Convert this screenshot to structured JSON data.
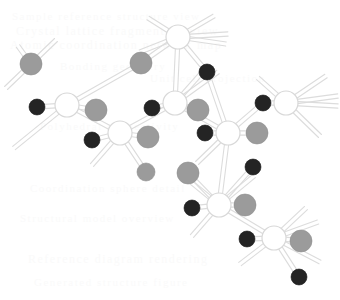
{
  "figure": {
    "width": 340,
    "height": 300,
    "background_color": "#ffffff"
  },
  "legend": {
    "atom_types": [
      {
        "key": "open",
        "label": "Open ring atom",
        "fill": "#ffffff",
        "stroke": "#d8d8d8",
        "radius": 11
      },
      {
        "key": "gray",
        "label": "Gray sphere atom",
        "fill": "#9b9b9b",
        "stroke": "#8f8f8f",
        "radius": 11
      },
      {
        "key": "dark",
        "label": "Dark sphere atom",
        "fill": "#242424",
        "stroke": "#1a1a1a",
        "radius": 8
      }
    ],
    "bond_style": {
      "label": "Double line bond",
      "color": "#dcdcdc",
      "width": 1.1,
      "offset": 2.1
    }
  },
  "structure": {
    "atoms": [
      {
        "id": "a1",
        "type": "open",
        "x": 178,
        "y": 37,
        "r": 12
      },
      {
        "id": "a2",
        "type": "gray",
        "x": 31,
        "y": 64,
        "r": 11
      },
      {
        "id": "a3",
        "type": "gray",
        "x": 141,
        "y": 63,
        "r": 11
      },
      {
        "id": "a4",
        "type": "dark",
        "x": 207,
        "y": 72,
        "r": 8
      },
      {
        "id": "a5",
        "type": "open",
        "x": 67,
        "y": 105,
        "r": 12
      },
      {
        "id": "a6",
        "type": "dark",
        "x": 37,
        "y": 107,
        "r": 8
      },
      {
        "id": "a7",
        "type": "open",
        "x": 175,
        "y": 103,
        "r": 12
      },
      {
        "id": "a8",
        "type": "dark",
        "x": 152,
        "y": 108,
        "r": 8
      },
      {
        "id": "a9",
        "type": "gray",
        "x": 198,
        "y": 110,
        "r": 11
      },
      {
        "id": "a10",
        "type": "open",
        "x": 286,
        "y": 103,
        "r": 12
      },
      {
        "id": "a11",
        "type": "dark",
        "x": 263,
        "y": 103,
        "r": 8
      },
      {
        "id": "a12",
        "type": "gray",
        "x": 96,
        "y": 110,
        "r": 11
      },
      {
        "id": "a13",
        "type": "open",
        "x": 120,
        "y": 133,
        "r": 12
      },
      {
        "id": "a14",
        "type": "dark",
        "x": 92,
        "y": 140,
        "r": 8
      },
      {
        "id": "a15",
        "type": "gray",
        "x": 148,
        "y": 137,
        "r": 11
      },
      {
        "id": "a16",
        "type": "open",
        "x": 228,
        "y": 133,
        "r": 12
      },
      {
        "id": "a17",
        "type": "dark",
        "x": 205,
        "y": 133,
        "r": 8
      },
      {
        "id": "a18",
        "type": "gray",
        "x": 257,
        "y": 133,
        "r": 11
      },
      {
        "id": "a19",
        "type": "gray",
        "x": 146,
        "y": 172,
        "r": 9
      },
      {
        "id": "a20",
        "type": "gray",
        "x": 188,
        "y": 173,
        "r": 11
      },
      {
        "id": "a21",
        "type": "dark",
        "x": 253,
        "y": 167,
        "r": 8
      },
      {
        "id": "a22",
        "type": "open",
        "x": 219,
        "y": 205,
        "r": 12
      },
      {
        "id": "a23",
        "type": "dark",
        "x": 192,
        "y": 208,
        "r": 8
      },
      {
        "id": "a24",
        "type": "gray",
        "x": 245,
        "y": 205,
        "r": 11
      },
      {
        "id": "a25",
        "type": "dark",
        "x": 247,
        "y": 239,
        "r": 8
      },
      {
        "id": "a26",
        "type": "open",
        "x": 274,
        "y": 238,
        "r": 12
      },
      {
        "id": "a27",
        "type": "gray",
        "x": 301,
        "y": 241,
        "r": 11
      },
      {
        "id": "a28",
        "type": "dark",
        "x": 299,
        "y": 277,
        "r": 8
      }
    ],
    "bonds": [
      {
        "from": "a1",
        "to": "a3"
      },
      {
        "from": "a1",
        "to": "a4"
      },
      {
        "from": "a1",
        "to": "a7"
      },
      {
        "from": "a3",
        "to": "a5"
      },
      {
        "from": "a5",
        "to": "a6"
      },
      {
        "from": "a5",
        "to": "a12"
      },
      {
        "from": "a5",
        "to": "a13"
      },
      {
        "from": "a7",
        "to": "a8"
      },
      {
        "from": "a7",
        "to": "a9"
      },
      {
        "from": "a7",
        "to": "a13"
      },
      {
        "from": "a7",
        "to": "a16"
      },
      {
        "from": "a4",
        "to": "a16"
      },
      {
        "from": "a10",
        "to": "a11"
      },
      {
        "from": "a11",
        "to": "a16"
      },
      {
        "from": "a13",
        "to": "a14"
      },
      {
        "from": "a13",
        "to": "a15"
      },
      {
        "from": "a13",
        "to": "a19"
      },
      {
        "from": "a16",
        "to": "a17"
      },
      {
        "from": "a16",
        "to": "a18"
      },
      {
        "from": "a16",
        "to": "a22"
      },
      {
        "from": "a20",
        "to": "a22"
      },
      {
        "from": "a22",
        "to": "a23"
      },
      {
        "from": "a22",
        "to": "a24"
      },
      {
        "from": "a22",
        "to": "a21"
      },
      {
        "from": "a22",
        "to": "a26"
      },
      {
        "from": "a26",
        "to": "a25"
      },
      {
        "from": "a26",
        "to": "a27"
      },
      {
        "from": "a26",
        "to": "a28"
      }
    ],
    "open_bonds": [
      {
        "from": "a2",
        "x2": 56,
        "y2": 40
      },
      {
        "from": "a2",
        "x2": 6,
        "y2": 88
      },
      {
        "from": "a5",
        "x2": 14,
        "y2": 148
      },
      {
        "from": "a1",
        "x2": 148,
        "y2": 18
      },
      {
        "from": "a1",
        "x2": 214,
        "y2": 16
      },
      {
        "from": "a1",
        "x2": 228,
        "y2": 34
      },
      {
        "from": "a1",
        "x2": 226,
        "y2": 44
      },
      {
        "from": "a1",
        "x2": 140,
        "y2": 52
      },
      {
        "from": "a7",
        "x2": 206,
        "y2": 68
      },
      {
        "from": "a7",
        "x2": 218,
        "y2": 72
      },
      {
        "from": "a13",
        "x2": 92,
        "y2": 165
      },
      {
        "from": "a10",
        "x2": 258,
        "y2": 78
      },
      {
        "from": "a10",
        "x2": 326,
        "y2": 76
      },
      {
        "from": "a10",
        "x2": 338,
        "y2": 96
      },
      {
        "from": "a10",
        "x2": 338,
        "y2": 106
      },
      {
        "from": "a10",
        "x2": 320,
        "y2": 136
      },
      {
        "from": "a16",
        "x2": 197,
        "y2": 163
      },
      {
        "from": "a22",
        "x2": 186,
        "y2": 178
      },
      {
        "from": "a22",
        "x2": 192,
        "y2": 236
      },
      {
        "from": "a22",
        "x2": 254,
        "y2": 176
      },
      {
        "from": "a26",
        "x2": 240,
        "y2": 264
      },
      {
        "from": "a26",
        "x2": 306,
        "y2": 208
      },
      {
        "from": "a26",
        "x2": 318,
        "y2": 222
      },
      {
        "from": "a26",
        "x2": 320,
        "y2": 262
      },
      {
        "from": "a2",
        "x2": 18,
        "y2": 46
      }
    ]
  },
  "watermark": {
    "color": "#fafafa",
    "lines": [
      {
        "text": "Sample reference structure view",
        "x": 12,
        "y": 10,
        "size": 11
      },
      {
        "text": "Crystal lattice fragment preview",
        "x": 16,
        "y": 24,
        "size": 12
      },
      {
        "text": "Atomic coordination network map",
        "x": 10,
        "y": 38,
        "size": 12
      },
      {
        "text": "Bonding geometry",
        "x": 60,
        "y": 60,
        "size": 11
      },
      {
        "text": "Unit cell projection",
        "x": 150,
        "y": 72,
        "size": 11
      },
      {
        "text": "Polyhedral connectivity",
        "x": 40,
        "y": 120,
        "size": 11
      },
      {
        "text": "Coordination sphere detail",
        "x": 30,
        "y": 182,
        "size": 11
      },
      {
        "text": "Structural model overview",
        "x": 20,
        "y": 212,
        "size": 11
      },
      {
        "text": "Reference diagram rendering",
        "x": 28,
        "y": 252,
        "size": 12
      },
      {
        "text": "Generated structure figure",
        "x": 34,
        "y": 276,
        "size": 11
      }
    ]
  }
}
